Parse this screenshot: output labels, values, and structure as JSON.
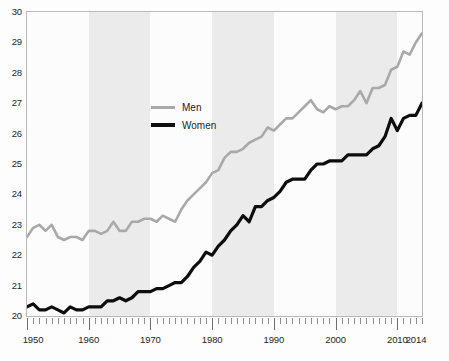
{
  "chart_data": {
    "type": "line",
    "title": "",
    "subtitle": "",
    "xlabel": "",
    "ylabel": "",
    "xlim": [
      1950,
      2014
    ],
    "ylim": [
      20,
      30
    ],
    "grid": false,
    "legend_position": "inside-upper-left",
    "y_ticks": [
      20,
      21,
      22,
      23,
      24,
      25,
      26,
      27,
      28,
      29,
      30
    ],
    "y_tick_labels": [
      "20",
      "21",
      "22",
      "23",
      "24",
      "25",
      "26",
      "27",
      "28",
      "29",
      "30"
    ],
    "x_ticks": [
      1950,
      1960,
      1970,
      1980,
      1990,
      2000,
      2010,
      2014
    ],
    "x_tick_labels": [
      "1950",
      "1960",
      "1970",
      "1980",
      "1990",
      "2000",
      "2010",
      "2014"
    ],
    "x_minor_tick_step": 1,
    "shaded_bands": [
      {
        "from": 1960,
        "to": 1970
      },
      {
        "from": 1980,
        "to": 1990
      },
      {
        "from": 2000,
        "to": 2010
      }
    ],
    "band_color": "#ebebeb",
    "x": [
      1950,
      1951,
      1952,
      1953,
      1954,
      1955,
      1956,
      1957,
      1958,
      1959,
      1960,
      1961,
      1962,
      1963,
      1964,
      1965,
      1966,
      1967,
      1968,
      1969,
      1970,
      1971,
      1972,
      1973,
      1974,
      1975,
      1976,
      1977,
      1978,
      1979,
      1980,
      1981,
      1982,
      1983,
      1984,
      1985,
      1986,
      1987,
      1988,
      1989,
      1990,
      1991,
      1992,
      1993,
      1994,
      1995,
      1996,
      1997,
      1998,
      1999,
      2000,
      2001,
      2002,
      2003,
      2004,
      2005,
      2006,
      2007,
      2008,
      2009,
      2010,
      2011,
      2012,
      2013,
      2014
    ],
    "series": [
      {
        "name": "Men",
        "color": "#a9a9a9",
        "width": 2.6,
        "values": [
          22.6,
          22.9,
          23.0,
          22.8,
          23.0,
          22.6,
          22.5,
          22.6,
          22.6,
          22.5,
          22.8,
          22.8,
          22.7,
          22.8,
          23.1,
          22.8,
          22.8,
          23.1,
          23.1,
          23.2,
          23.2,
          23.1,
          23.3,
          23.2,
          23.1,
          23.5,
          23.8,
          24.0,
          24.2,
          24.4,
          24.7,
          24.8,
          25.2,
          25.4,
          25.4,
          25.5,
          25.7,
          25.8,
          25.9,
          26.2,
          26.1,
          26.3,
          26.5,
          26.5,
          26.7,
          26.9,
          27.1,
          26.8,
          26.7,
          26.9,
          26.8,
          26.9,
          26.9,
          27.1,
          27.4,
          27.0,
          27.5,
          27.5,
          27.6,
          28.1,
          28.2,
          28.7,
          28.6,
          29.0,
          29.3
        ]
      },
      {
        "name": "Women",
        "color": "#0d0d0d",
        "width": 3.2,
        "values": [
          20.3,
          20.4,
          20.2,
          20.2,
          20.3,
          20.2,
          20.1,
          20.3,
          20.2,
          20.2,
          20.3,
          20.3,
          20.3,
          20.5,
          20.5,
          20.6,
          20.5,
          20.6,
          20.8,
          20.8,
          20.8,
          20.9,
          20.9,
          21.0,
          21.1,
          21.1,
          21.3,
          21.6,
          21.8,
          22.1,
          22.0,
          22.3,
          22.5,
          22.8,
          23.0,
          23.3,
          23.1,
          23.6,
          23.6,
          23.8,
          23.9,
          24.1,
          24.4,
          24.5,
          24.5,
          24.5,
          24.8,
          25.0,
          25.0,
          25.1,
          25.1,
          25.1,
          25.3,
          25.3,
          25.3,
          25.3,
          25.5,
          25.6,
          25.9,
          26.5,
          26.1,
          26.5,
          26.6,
          26.6,
          27.0
        ]
      }
    ],
    "legend": [
      {
        "label": "Men",
        "color": "#a9a9a9"
      },
      {
        "label": "Women",
        "color": "#0d0d0d"
      }
    ]
  }
}
